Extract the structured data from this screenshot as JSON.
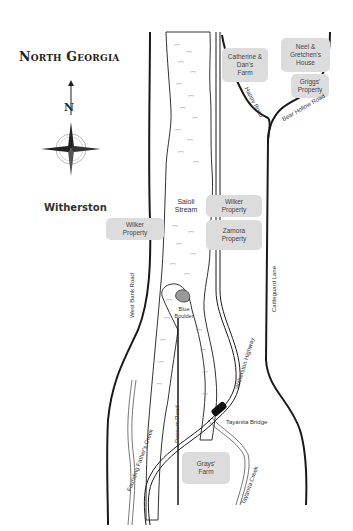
{
  "map": {
    "title": "North Georgia",
    "town": "Witherston",
    "compass": {
      "north_label": "N"
    },
    "parcels": [
      {
        "id": "catherine-dans-farm",
        "label": "Catherine &\nDan's\nFarm"
      },
      {
        "id": "neel-gretchens-house",
        "label": "Neel &\nGretchen's\nHouse"
      },
      {
        "id": "griggs-property",
        "label": "Griggs'\nProperty"
      },
      {
        "id": "wilker-property-west",
        "label": "Wilker\nProperty"
      },
      {
        "id": "wilker-property-east",
        "label": "Wilker\nProperty"
      },
      {
        "id": "zamora-property",
        "label": "Zamora\nProperty"
      },
      {
        "id": "grays-farm",
        "label": "Grays'\nFarm"
      }
    ],
    "water": {
      "stream": "Saloli\nStream",
      "founding_fathers_creek": "Founding Father's Creek",
      "tayanita_creek": "Tayanita Creek"
    },
    "roads": {
      "happy_road": "Happy Road",
      "bear_hollow_road": "Bear Hollow Road",
      "west_bank_road": "West Bank Road",
      "cattleguard_lane": "Cattleguard Lane",
      "witherston_highway": "Witherston Highway",
      "possum_road": "Possum Road"
    },
    "landmarks": {
      "blue_boulder": "Blue\nBoulder",
      "tayanita_bridge": "Tayanita Bridge"
    },
    "colors": {
      "road": "#1a1a1a",
      "parcel_fill": "#dcdcdc",
      "water_line": "#444444",
      "background": "#ffffff"
    }
  }
}
